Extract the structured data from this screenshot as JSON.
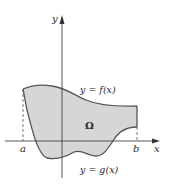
{
  "figure": {
    "type": "region-between-curves",
    "colors": {
      "region_fill": "#d6d6d6",
      "curve_stroke": "#555555",
      "axis_stroke": "#444444",
      "text": "#2a2a2a"
    },
    "axes": {
      "x_label": "x",
      "y_label": "y"
    },
    "points": {
      "a_label": "a",
      "b_label": "b"
    },
    "curves": {
      "upper_label": "y = f(x)",
      "lower_label": "y = g(x)"
    },
    "region_label": "Ω"
  }
}
